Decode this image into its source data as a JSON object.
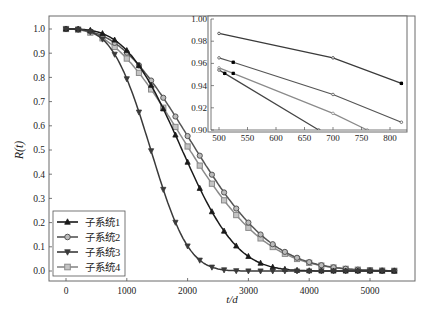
{
  "chart_data": [
    {
      "type": "line",
      "title": "",
      "xlabel": "t/d",
      "ylabel": "R(t)",
      "xlim": [
        -280,
        5850
      ],
      "ylim": [
        -0.04,
        1.06
      ],
      "xticks": [
        0,
        1000,
        2000,
        3000,
        4000,
        5000
      ],
      "yticks": [
        0.0,
        0.1,
        0.2,
        0.3,
        0.4,
        0.5,
        0.6,
        0.7,
        0.8,
        0.9,
        1.0
      ],
      "ytick_labels": [
        "0.0",
        "0.1",
        "0.2",
        "0.3",
        "0.4",
        "0.5",
        "0.6",
        "0.7",
        "0.8",
        "0.9",
        "1.0"
      ],
      "legend_position": "lower left",
      "grid": false,
      "series": [
        {
          "name": "子系统1",
          "marker": "triangle-up",
          "color": "#1a1a1a",
          "model": {
            "eta": 2150,
            "beta": 3.1
          }
        },
        {
          "name": "子系统2",
          "marker": "circle",
          "color": "#555555",
          "model": {
            "eta": 2480,
            "beta": 2.5
          }
        },
        {
          "name": "子系统3",
          "marker": "triangle-down",
          "color": "#3a3a3a",
          "model": {
            "eta": 1560,
            "beta": 3.3
          }
        },
        {
          "name": "子系统4",
          "marker": "square",
          "color": "#8a8a8a",
          "model": {
            "eta": 2380,
            "beta": 2.35
          }
        }
      ],
      "x": [
        0,
        200,
        400,
        600,
        800,
        1000,
        1200,
        1400,
        1600,
        1800,
        2000,
        2200,
        2400,
        2600,
        2800,
        3000,
        3200,
        3400,
        3600,
        3800,
        4000,
        4200,
        4400,
        4600,
        4800,
        5000,
        5200,
        5400
      ]
    },
    {
      "type": "line",
      "title": "inset",
      "xlabel": "",
      "ylabel": "",
      "xlim": [
        485,
        835
      ],
      "ylim": [
        0.9,
        1.0
      ],
      "xticks": [
        500,
        550,
        600,
        650,
        700,
        750,
        800
      ],
      "yticks": [
        0.9,
        0.92,
        0.94,
        0.96,
        0.98,
        1.0
      ],
      "ytick_labels": [
        "0.90",
        "0.92",
        "0.94",
        "0.96",
        "0.98",
        "1.00"
      ],
      "series": [
        {
          "name": "子系统1",
          "points": [
            [
              500,
              0.987
            ],
            [
              700,
              0.965
            ],
            [
              820,
              0.942
            ]
          ],
          "highlight": [
            [
              820,
              0.942
            ]
          ]
        },
        {
          "name": "子系统2",
          "points": [
            [
              500,
              0.965
            ],
            [
              525,
              0.961
            ],
            [
              700,
              0.932
            ],
            [
              820,
              0.907
            ]
          ],
          "highlight": [
            [
              525,
              0.961
            ]
          ]
        },
        {
          "name": "子系统4",
          "points": [
            [
              500,
              0.956
            ],
            [
              525,
              0.951
            ],
            [
              700,
              0.915
            ],
            [
              760,
              0.9
            ]
          ],
          "highlight": [
            [
              525,
              0.951
            ]
          ]
        },
        {
          "name": "子系统3",
          "points": [
            [
              500,
              0.954
            ],
            [
              510,
              0.951
            ],
            [
              675,
              0.9
            ]
          ],
          "highlight": [
            [
              510,
              0.951
            ]
          ]
        }
      ]
    }
  ],
  "legend": {
    "items": [
      "子系统1",
      "子系统2",
      "子系统3",
      "子系统4"
    ]
  },
  "axes": {
    "xlabel": "t/d",
    "ylabel": "R(t)"
  }
}
